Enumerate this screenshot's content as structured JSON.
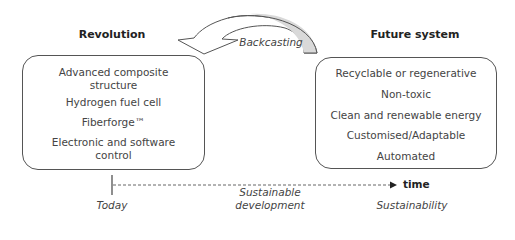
{
  "diagram": {
    "left_column": {
      "heading": "Revolution",
      "items": [
        "Advanced composite\nstructure",
        "Hydrogen fuel cell",
        "Fiberforge™",
        "Electronic and software\ncontrol"
      ]
    },
    "right_column": {
      "heading": "Future system",
      "items": [
        "Recyclable or regenerative",
        "Non-toxic",
        "Clean and renewable energy",
        "Customised/Adaptable",
        "Automated"
      ]
    },
    "arrow_label": "Backcasting",
    "timeline": {
      "axis_label": "time",
      "start_label": "Today",
      "middle_label": "Sustainable\ndevelopment",
      "end_label": "Sustainability"
    },
    "colors": {
      "arrow_fill": "#d9d9d9",
      "stroke": "#555555"
    }
  }
}
